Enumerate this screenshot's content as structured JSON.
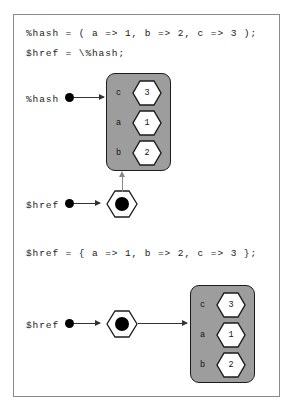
{
  "figure": {
    "background_color": "#ffffff",
    "frame_border_color": "#8a8a8a",
    "box_fill_color": "#9d9d9d",
    "box_border_color": "#1c1c1c",
    "hex_fill_color": "#ffffff",
    "dot_color": "#000000",
    "arrow_color": "#333333"
  },
  "code": {
    "line1": "%hash = ( a => 1, b => 2, c => 3 );",
    "line2": "$href = \\%hash;",
    "line3": "$href = { a => 1, b => 2, c => 3 };"
  },
  "labels": {
    "hash_var": "%hash",
    "href_var_top": "$href",
    "href_var_bottom": "$href"
  },
  "hash_box_top": {
    "rows": [
      {
        "key": "c",
        "value": "3"
      },
      {
        "key": "a",
        "value": "1"
      },
      {
        "key": "b",
        "value": "2"
      }
    ]
  },
  "hash_box_bottom": {
    "rows": [
      {
        "key": "c",
        "value": "3"
      },
      {
        "key": "a",
        "value": "1"
      },
      {
        "key": "b",
        "value": "2"
      }
    ]
  }
}
